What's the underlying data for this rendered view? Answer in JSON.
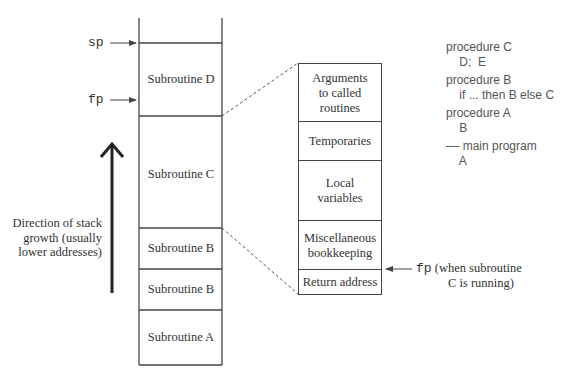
{
  "pointers": {
    "sp": "sp",
    "fp": "fp"
  },
  "stack": {
    "frames": [
      {
        "label": "Subroutine D"
      },
      {
        "label": "Subroutine C"
      },
      {
        "label": "Subroutine B"
      },
      {
        "label": "Subroutine B"
      },
      {
        "label": "Subroutine A"
      }
    ]
  },
  "growth_label": {
    "line1": "Direction of stack",
    "line2": "growth (usually",
    "line3": "lower addresses)"
  },
  "frame_detail": {
    "cells": [
      {
        "line1": "Arguments",
        "line2": "to called",
        "line3": "routines"
      },
      {
        "line1": "Temporaries"
      },
      {
        "line1": "Local",
        "line2": "variables"
      },
      {
        "line1": "Miscellaneous",
        "line2": "bookkeeping"
      },
      {
        "line1": "Return address"
      }
    ],
    "fp_label": "fp",
    "fp_note_line1": "(when subroutine",
    "fp_note_line2": "C is running)"
  },
  "code": {
    "lines": [
      "procedure C",
      "    D;  E",
      "procedure B",
      "    if ... then B else C",
      "procedure A",
      "    B",
      "–– main program",
      "    A"
    ]
  },
  "colors": {
    "line": "#444444",
    "text": "#333333",
    "code_text": "#555555",
    "background": "#ffffff"
  }
}
